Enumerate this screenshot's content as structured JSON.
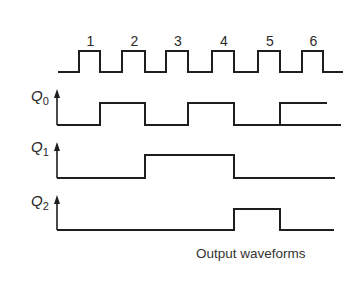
{
  "diagram": {
    "type": "timing-diagram",
    "caption": "Output waveforms",
    "clock": {
      "name": "clock",
      "pulse_labels": [
        "1",
        "2",
        "3",
        "4",
        "5",
        "6"
      ],
      "pulse_count": 6
    },
    "signals": [
      {
        "name": "Q",
        "subscript": "0",
        "description": "toggles on every falling clock edge",
        "high_intervals_in_clock_periods": [
          [
            1,
            2
          ],
          [
            3,
            4
          ],
          [
            5,
            5.5
          ]
        ]
      },
      {
        "name": "Q",
        "subscript": "1",
        "description": "toggles on every falling edge of Q0",
        "high_intervals_in_clock_periods": [
          [
            2,
            4
          ]
        ]
      },
      {
        "name": "Q",
        "subscript": "2",
        "description": "toggles on every falling edge of Q1",
        "high_intervals_in_clock_periods": [
          [
            4,
            5
          ]
        ]
      }
    ],
    "colors": {
      "line": "#1e1e1e",
      "text": "#2a2a2a",
      "background": "#ffffff"
    }
  }
}
